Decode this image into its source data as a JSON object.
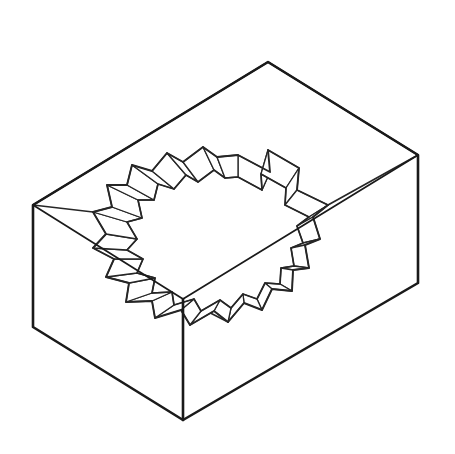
{
  "document": {
    "title": "Isometric Block with Scalloped Through-Hole",
    "kind": "technical-line-drawing",
    "projection": "isometric",
    "background_color": "#ffffff",
    "line_color_heavy": "#1a1a1a",
    "line_color_light": "#262626",
    "stroke_width_heavy": 2.6,
    "stroke_width_medium": 1.7,
    "stroke_width_light": 1.3,
    "canvas": {
      "width": 455,
      "height": 454
    }
  },
  "geometry": {
    "block": {
      "name": "rectangular-prism",
      "top_face_vertices": "33,205 268,62 418,155 183,299",
      "front_left_face_vertices": "33,205 183,299 183,420 33,327",
      "front_right_face_vertices": "183,299 418,155 418,283 183,420",
      "top_outline": "M 33,205 L 268,62 L 418,155 L 183,299 Z",
      "silhouette": "M 33,205 L 268,62 L 418,155 L 418,283 L 183,420 L 33,327 Z",
      "vertical_edge_front": "M 183,299 L 183,420",
      "corners": {
        "top_left": "33,205",
        "top_back": "268,62",
        "top_right": "418,155",
        "top_front": "183,299",
        "bottom_left": "33,327",
        "bottom_right": "418,283",
        "bottom_front": "183,420"
      }
    },
    "hole": {
      "name": "scalloped-cog-through-hole",
      "tooth_count": 18,
      "rim_top_outline": "M 238,155 L 270,172 L 268,150 L 299,168 L 297,190 L 328,205 L 313,217 L 320,239 L 305,245 L 309,268 L 293,270 L 292,291 L 272,289 L 262,310 L 244,303 L 228,322 L 214,311 L 190,325 L 181,310 L 155,318 L 152,301 L 126,302 L 129,283 L 106,277 L 114,259 L 93,248 L 106,234 L 93,212 L 112,207 L 107,185 L 127,185 L 132,165 L 152,171 L 167,153 L 183,162 L 203,147 L 217,157 Z",
      "rim_inner_outline": "M 238,177 L 262,190 L 261,174 L 286,188 L 285,205 L 309,217 L 297,226 L 303,243 L 291,248 L 294,266 L 281,268 L 280,284 L 265,283 L 257,299 L 243,294 L 231,308 L 220,300 L 201,311 L 194,299 L 174,305 L 172,292 L 152,293 L 155,278 L 137,273 L 143,259 L 127,250 L 137,239 L 127,222 L 142,218 L 138,200 L 154,200 L 158,184 L 174,189 L 186,175 L 198,182 L 214,170 L 225,178 Z",
      "facet_walls": [
        {
          "name": "wall-facet-01",
          "points": "238,155 270,172 262,190 238,177"
        },
        {
          "name": "wall-facet-02",
          "points": "270,172 268,150 261,174 262,190"
        },
        {
          "name": "wall-facet-03",
          "points": "268,150 299,168 286,188 261,174"
        },
        {
          "name": "wall-facet-04",
          "points": "299,168 297,190 285,205 286,188"
        },
        {
          "name": "wall-facet-05",
          "points": "297,190 328,205 309,217 285,205"
        },
        {
          "name": "wall-facet-06",
          "points": "328,205 313,217 297,226 309,217"
        },
        {
          "name": "wall-facet-07",
          "points": "313,217 320,239 303,243 297,226"
        },
        {
          "name": "wall-facet-08",
          "points": "320,239 305,245 291,248 303,243"
        },
        {
          "name": "wall-facet-09",
          "points": "305,245 309,268 294,266 291,248"
        },
        {
          "name": "wall-facet-10",
          "points": "309,268 293,270 281,268 294,266"
        },
        {
          "name": "wall-facet-11",
          "points": "293,270 292,291 280,284 281,268"
        },
        {
          "name": "wall-facet-12",
          "points": "292,291 272,289 265,283 280,284"
        },
        {
          "name": "wall-facet-13",
          "points": "272,289 262,310 257,299 265,283"
        },
        {
          "name": "wall-facet-14",
          "points": "262,310 244,303 243,294 257,299"
        },
        {
          "name": "wall-facet-15",
          "points": "244,303 228,322 231,308 243,294"
        },
        {
          "name": "wall-facet-16",
          "points": "228,322 214,311 220,300 231,308"
        },
        {
          "name": "wall-facet-17",
          "points": "214,311 190,325 201,311 220,300"
        },
        {
          "name": "wall-facet-18",
          "points": "190,325 181,310 194,299 201,311"
        },
        {
          "name": "wall-facet-19",
          "points": "181,310 155,318 174,305 194,299"
        },
        {
          "name": "wall-facet-20",
          "points": "155,318 152,301 172,292 174,305"
        },
        {
          "name": "wall-facet-21",
          "points": "152,301 126,302 152,293 172,292"
        },
        {
          "name": "wall-facet-22",
          "points": "126,302 129,283 155,278 152,293"
        },
        {
          "name": "wall-facet-23",
          "points": "129,283 106,277 137,273 155,278"
        },
        {
          "name": "wall-facet-24",
          "points": "106,277 114,259 143,259 137,273"
        },
        {
          "name": "wall-facet-25",
          "points": "114,259 93,248 127,250 143,259"
        },
        {
          "name": "wall-facet-26",
          "points": "93,248 106,234 137,239 127,250"
        },
        {
          "name": "wall-facet-27",
          "points": "106,234 93,212 127,222 137,239"
        },
        {
          "name": "wall-facet-28",
          "points": "93,212 112,207 142,218 127,222"
        },
        {
          "name": "wall-facet-29",
          "points": "112,207 107,185 138,200 142,218"
        },
        {
          "name": "wall-facet-30",
          "points": "107,185 127,185 154,200 138,200"
        },
        {
          "name": "wall-facet-31",
          "points": "127,185 132,165 158,184 154,200"
        },
        {
          "name": "wall-facet-32",
          "points": "132,165 152,171 174,189 158,184"
        },
        {
          "name": "wall-facet-33",
          "points": "152,171 167,153 186,175 174,189"
        },
        {
          "name": "wall-facet-34",
          "points": "167,153 183,162 198,182 186,175"
        },
        {
          "name": "wall-facet-35",
          "points": "183,162 203,147 214,170 198,182"
        },
        {
          "name": "wall-facet-36",
          "points": "203,147 217,157 225,178 214,170"
        },
        {
          "name": "wall-facet-37",
          "points": "217,157 238,155 238,177 225,178"
        }
      ],
      "rim_to_corner_connectors": [
        {
          "name": "connector-left",
          "path": "M 93,212 L 33,205"
        },
        {
          "name": "connector-right",
          "path": "M 328,205 L 418,155"
        },
        {
          "name": "connector-front",
          "path": "M 228,322 L 183,299"
        },
        {
          "name": "connector-front-down",
          "path": "M 183,345 L 183,420"
        }
      ]
    }
  }
}
